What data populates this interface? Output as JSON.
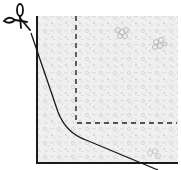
{
  "diagram": {
    "colors": {
      "background": "#ffffff",
      "paper_texture": "#e4e4e4",
      "paper_texture_dark": "#c8c8c8",
      "line": "#1a1a1a",
      "dashed_line": "#222222"
    },
    "icons": {
      "scissors": "scissors-icon"
    }
  }
}
